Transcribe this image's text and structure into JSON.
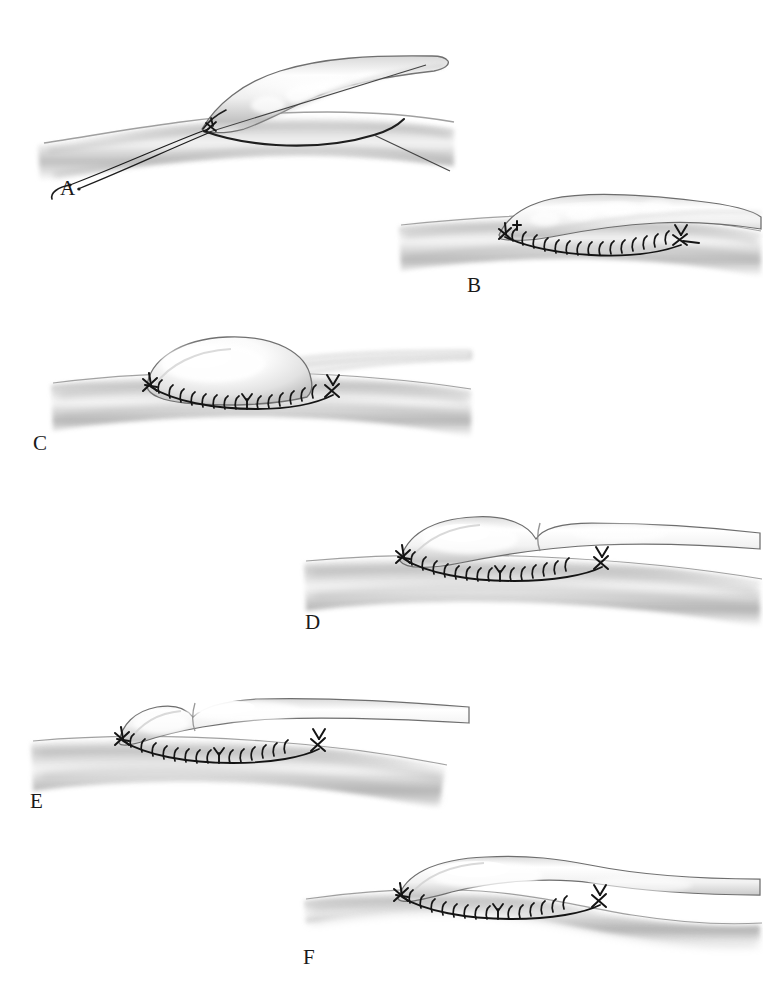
{
  "figure": {
    "style": "grayscale medical airbrush illustration",
    "background_color": "#ffffff",
    "ink_color": "#1a1a1a",
    "vessel_light": "#ffffff",
    "vessel_mid": "#c9c9c9",
    "vessel_shadow": "#8e8e8e",
    "suture_color": "#161616",
    "panel_count": 6
  },
  "panels": [
    {
      "id": "A",
      "label": "A",
      "label_x": 60,
      "label_y": 178,
      "caption": "Graft vessel positioned over host arteriotomy with double-armed suture and needle held at corner apex",
      "elements": [
        "graft-vessel",
        "host-vessel",
        "arteriotomy-outline",
        "corner-anchor-stitch",
        "suture-thread-pair",
        "curved-needle"
      ],
      "suture_state": "thread-placed",
      "stitch_count": 0
    },
    {
      "id": "B",
      "label": "B",
      "label_x": 470,
      "label_y": 282,
      "caption": "Running suture line completed along near side of anastomosis, graft enters at acute angle",
      "elements": [
        "graft-vessel",
        "host-vessel",
        "running-suture-line",
        "left-corner-knot",
        "right-corner-knot"
      ],
      "suture_state": "running-complete",
      "stitch_count": 15
    },
    {
      "id": "C",
      "label": "C",
      "label_x": 34,
      "label_y": 438,
      "caption": "Tall domed anastomosis profile showing excessive graft redundancy at the hood",
      "elements": [
        "graft-vessel-domed",
        "host-vessel",
        "running-suture-line",
        "left-corner-knot",
        "right-corner-knot",
        "mid-stitch-marker"
      ],
      "suture_state": "running-complete",
      "stitch_count": 16
    },
    {
      "id": "D",
      "label": "D",
      "label_x": 305,
      "label_y": 612,
      "caption": "Bilobed hood contour with a mid-graft constriction narrowing the outflow",
      "elements": [
        "graft-vessel-bilobed",
        "host-vessel",
        "running-suture-line",
        "left-corner-knot",
        "right-corner-knot",
        "mid-stitch-marker"
      ],
      "suture_state": "running-complete",
      "stitch_count": 15
    },
    {
      "id": "E",
      "label": "E",
      "label_x": 30,
      "label_y": 798,
      "caption": "Low flat hood profile with small proximal bulge and tapering graft limb",
      "elements": [
        "graft-vessel-flat",
        "host-vessel",
        "running-suture-line",
        "left-corner-knot",
        "right-corner-knot",
        "mid-stitch-marker"
      ],
      "suture_state": "running-complete",
      "stitch_count": 15
    },
    {
      "id": "F",
      "label": "F",
      "label_x": 303,
      "label_y": 952,
      "caption": "Optimal smooth tapered hood with gentle transition onto the host vessel",
      "elements": [
        "graft-vessel-tapered",
        "host-vessel-waisted",
        "running-suture-line",
        "left-corner-knot",
        "right-corner-knot",
        "mid-stitch-marker"
      ],
      "suture_state": "running-complete",
      "stitch_count": 15
    }
  ]
}
